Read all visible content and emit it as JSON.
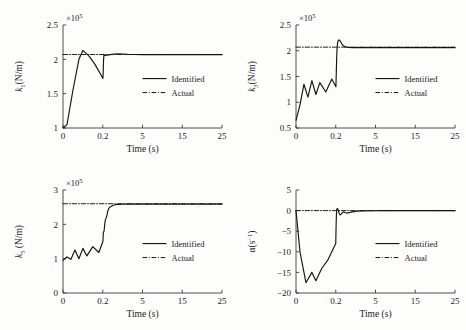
{
  "figure": {
    "background": "#fdfdfc",
    "line_color": "#1a1a1a",
    "panel_count": 4
  },
  "legend": {
    "identified_label": "Identified",
    "actual_label": "Actual",
    "identified_style": "solid",
    "actual_style": "dash-dot"
  },
  "common": {
    "xlabel": "Time (s)",
    "exponent_label": "×10",
    "exponent_power": "5",
    "xticks": [
      "0",
      "0.2",
      "5",
      "15",
      "25"
    ]
  },
  "chart_data": [
    {
      "type": "line",
      "panel": "top-left",
      "title": "",
      "xlabel": "Time (s)",
      "ylabel": "k",
      "ylabel_sub": "1",
      "ylabel_unit": "(N/m)",
      "yscale_exponent": "×10⁵",
      "xlim": [
        0,
        25
      ],
      "ylim": [
        1,
        2.5
      ],
      "xticks": [
        "0",
        "0.2",
        "5",
        "15",
        "25"
      ],
      "xtick_values": [
        0,
        0.2,
        5,
        15,
        25
      ],
      "yticks": [
        "1",
        "1.5",
        "2",
        "2.5"
      ],
      "ytick_values": [
        1,
        1.5,
        2,
        2.5
      ],
      "grid": false,
      "legend_position": "center-right",
      "series": [
        {
          "name": "Identified",
          "style": "solid",
          "x": [
            0.0,
            0.02,
            0.05,
            0.08,
            0.1,
            0.13,
            0.16,
            0.19,
            0.22,
            0.25,
            0.3,
            0.35,
            0.4,
            0.5,
            0.6,
            0.75,
            0.9,
            1.1,
            1.3,
            1.6,
            2.0,
            2.6,
            3.2,
            4.0,
            5.0,
            7.0,
            10.0,
            14.0,
            18.0,
            22.0,
            25.0
          ],
          "y": [
            1.0,
            1.05,
            1.55,
            2.0,
            2.13,
            2.05,
            1.93,
            1.78,
            1.72,
            1.8,
            2.0,
            2.07,
            2.06,
            2.055,
            2.06,
            2.062,
            2.065,
            2.068,
            2.072,
            2.078,
            2.08,
            2.078,
            2.073,
            2.07,
            2.069,
            2.068,
            2.068,
            2.068,
            2.068,
            2.068,
            2.068
          ]
        },
        {
          "name": "Actual",
          "style": "dash-dot",
          "x": [
            0,
            25
          ],
          "y": [
            2.07,
            2.07
          ]
        }
      ]
    },
    {
      "type": "line",
      "panel": "top-right",
      "title": "",
      "xlabel": "Time (s)",
      "ylabel": "k",
      "ylabel_sub": "3",
      "ylabel_unit": "(N/m)",
      "yscale_exponent": "×10⁵",
      "xlim": [
        0,
        25
      ],
      "ylim": [
        0.5,
        2.5
      ],
      "xticks": [
        "0",
        "0.2",
        "5",
        "15",
        "25"
      ],
      "xtick_values": [
        0,
        0.2,
        5,
        15,
        25
      ],
      "yticks": [
        "0.5",
        "1",
        "1.5",
        "2",
        "2.5"
      ],
      "ytick_values": [
        0.5,
        1,
        1.5,
        2,
        2.5
      ],
      "grid": false,
      "legend_position": "center-right",
      "series": [
        {
          "name": "Identified",
          "style": "solid",
          "x": [
            0.0,
            0.02,
            0.04,
            0.06,
            0.08,
            0.1,
            0.12,
            0.15,
            0.18,
            0.22,
            0.26,
            0.3,
            0.35,
            0.42,
            0.5,
            0.6,
            0.7,
            0.8,
            0.95,
            1.1,
            1.3,
            1.5,
            1.8,
            2.2,
            2.8,
            3.5,
            5.0,
            7.0,
            10.0,
            14.0,
            18.0,
            22.0,
            25.0
          ],
          "y": [
            0.65,
            0.95,
            1.35,
            1.1,
            1.42,
            1.15,
            1.38,
            1.2,
            1.45,
            1.3,
            1.55,
            1.8,
            2.02,
            2.15,
            2.2,
            2.21,
            2.2,
            2.17,
            2.13,
            2.1,
            2.08,
            2.07,
            2.065,
            2.062,
            2.06,
            2.06,
            2.06,
            2.06,
            2.06,
            2.06,
            2.06,
            2.06,
            2.06
          ]
        },
        {
          "name": "Actual",
          "style": "dash-dot",
          "x": [
            0,
            25
          ],
          "y": [
            2.07,
            2.07
          ]
        }
      ]
    },
    {
      "type": "line",
      "panel": "bottom-left",
      "title": "",
      "xlabel": "Time (s)",
      "ylabel": "k",
      "ylabel_sub": "5",
      "ylabel_unit": " (N/m)",
      "yscale_exponent": "×10⁵",
      "xlim": [
        0,
        25
      ],
      "ylim": [
        0,
        3
      ],
      "xticks": [
        "0",
        "0.2",
        "5",
        "15",
        "25"
      ],
      "xtick_values": [
        0,
        0.2,
        5,
        15,
        25
      ],
      "yticks": [
        "0",
        "1",
        "2",
        "3"
      ],
      "ytick_values": [
        0,
        1,
        2,
        3
      ],
      "grid": false,
      "legend_position": "center-right",
      "series": [
        {
          "name": "Identified",
          "style": "solid",
          "x": [
            0.0,
            0.02,
            0.04,
            0.06,
            0.08,
            0.1,
            0.12,
            0.15,
            0.18,
            0.22,
            0.26,
            0.3,
            0.36,
            0.42,
            0.5,
            0.6,
            0.7,
            0.8,
            0.9,
            1.05,
            1.2,
            1.4,
            1.7,
            2.1,
            2.6,
            3.2,
            4.0,
            5.5,
            8.0,
            12.0,
            16.0,
            20.0,
            25.0
          ],
          "y": [
            0.95,
            1.05,
            0.98,
            1.25,
            1.0,
            1.3,
            1.08,
            1.35,
            1.18,
            1.5,
            1.72,
            1.78,
            1.8,
            1.95,
            2.12,
            2.18,
            2.25,
            2.38,
            2.45,
            2.5,
            2.52,
            2.55,
            2.57,
            2.58,
            2.585,
            2.59,
            2.59,
            2.59,
            2.59,
            2.59,
            2.59,
            2.59,
            2.59
          ]
        },
        {
          "name": "Actual",
          "style": "dash-dot",
          "x": [
            0,
            25
          ],
          "y": [
            2.6,
            2.6
          ]
        }
      ]
    },
    {
      "type": "line",
      "panel": "bottom-right",
      "title": "",
      "xlabel": "Time (s)",
      "ylabel": "α(s",
      "ylabel_sup": "−1",
      "ylabel_unit": ")",
      "yscale_exponent": "",
      "xlim": [
        0,
        25
      ],
      "ylim": [
        -20,
        5
      ],
      "xticks": [
        "0",
        "0.2",
        "5",
        "15",
        "25"
      ],
      "xtick_values": [
        0,
        0.2,
        5,
        15,
        25
      ],
      "yticks": [
        "5",
        "0",
        "−5",
        "−10",
        "−15",
        "−20"
      ],
      "ytick_values": [
        5,
        0,
        -5,
        -10,
        -15,
        -20
      ],
      "grid": false,
      "legend_position": "center-right",
      "series": [
        {
          "name": "Identified",
          "style": "solid",
          "x": [
            0.0,
            0.02,
            0.05,
            0.08,
            0.1,
            0.13,
            0.16,
            0.2,
            0.24,
            0.28,
            0.33,
            0.4,
            0.48,
            0.56,
            0.65,
            0.75,
            0.85,
            1.0,
            1.15,
            1.3,
            1.5,
            1.8,
            2.2,
            2.8,
            3.5,
            5.0,
            7.0,
            10.0,
            14.0,
            18.0,
            22.0,
            25.0
          ],
          "y": [
            0.0,
            -10.0,
            -17.5,
            -15.0,
            -17.0,
            -14.0,
            -12.0,
            -8.0,
            -4.0,
            -1.0,
            0.4,
            0.5,
            0.3,
            -0.3,
            -0.9,
            -1.05,
            -0.85,
            -0.5,
            -0.3,
            -0.45,
            -0.6,
            -0.5,
            -0.3,
            -0.15,
            -0.08,
            -0.04,
            -0.02,
            -0.02,
            -0.02,
            -0.02,
            -0.02,
            -0.02
          ]
        },
        {
          "name": "Actual",
          "style": "dash-dot",
          "x": [
            0,
            25
          ],
          "y": [
            0,
            0
          ]
        }
      ]
    }
  ]
}
